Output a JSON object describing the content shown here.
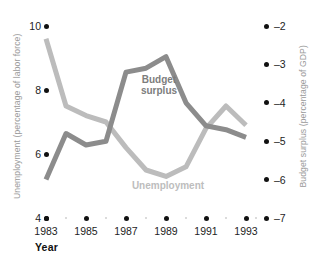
{
  "chart_data": {
    "type": "line",
    "title": "",
    "xlabel": "Year",
    "x": [
      1983,
      1984,
      1985,
      1986,
      1987,
      1988,
      1989,
      1990,
      1991,
      1992,
      1993
    ],
    "xtick_labels": [
      "1983",
      "1985",
      "1987",
      "1989",
      "1991",
      "1993"
    ],
    "xtick_values": [
      1983,
      1985,
      1987,
      1989,
      1991,
      1993
    ],
    "xminor_values": [
      1984,
      1986,
      1988,
      1990,
      1992
    ],
    "grid": false,
    "legend_position": "inline-annotations",
    "axes": [
      {
        "side": "left",
        "label": "Unemployment (percentage of labor force)",
        "ticks": [
          "10",
          "8",
          "6",
          "4"
        ],
        "tick_values": [
          10,
          8,
          6,
          4
        ],
        "range": [
          4,
          10
        ]
      },
      {
        "side": "right",
        "label": "Budget surplus (percentage of GDP)",
        "ticks": [
          "–2",
          "–3",
          "–4",
          "–5",
          "–6",
          "–7"
        ],
        "tick_values": [
          -2,
          -3,
          -4,
          -5,
          -6,
          -7
        ],
        "range": [
          -7,
          -2
        ]
      }
    ],
    "series": [
      {
        "name": "Unemployment",
        "axis": "left",
        "units": "percentage of labor force",
        "color": "#bcbcbc",
        "annotation": "Unemployment",
        "values": [
          9.6,
          7.5,
          7.2,
          7.0,
          6.2,
          5.5,
          5.3,
          5.6,
          6.8,
          7.5,
          6.9
        ]
      },
      {
        "name": "Budget surplus",
        "axis": "right",
        "units": "percentage of GDP",
        "color": "#8c8c8c",
        "annotation": "Budget surplus",
        "values": [
          -6.0,
          -4.8,
          -5.1,
          -5.0,
          -3.2,
          -3.1,
          -2.8,
          -4.0,
          -4.6,
          -4.7,
          -4.9
        ]
      }
    ]
  },
  "annotations": {
    "budget_label": "Budget\nsurplus",
    "budget_label_line1": "Budget",
    "budget_label_line2": "surplus",
    "unemployment_label": "Unemployment"
  },
  "axis_titles": {
    "left": "Unemployment (percentage of labor force)",
    "right": "Budget surplus (percentage of GDP)",
    "x_caption": "Year"
  },
  "ticks": {
    "left": [
      "10",
      "8",
      "6",
      "4"
    ],
    "right": [
      "–2",
      "–3",
      "–4",
      "–5",
      "–6",
      "–7"
    ],
    "x": [
      "1983",
      "1985",
      "1987",
      "1989",
      "1991",
      "1993"
    ]
  },
  "colors": {
    "unemployment": "#bcbcbc",
    "budget_surplus": "#8c8c8c",
    "tick_dot": "#111111",
    "minor_dot": "#cfcfcf",
    "axis_title": "#9a9a9a",
    "background": "#ffffff"
  }
}
